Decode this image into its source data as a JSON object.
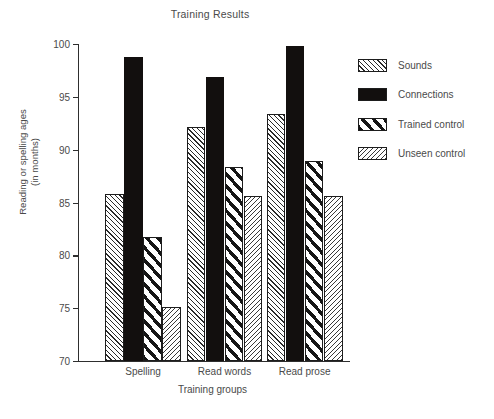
{
  "chart_data": {
    "type": "bar",
    "title": "Training Results",
    "xlabel": "Training groups",
    "ylabel": "Reading or spelling ages",
    "ylabel_line2": "(in months)",
    "categories": [
      "Spelling",
      "Read words",
      "Read prose"
    ],
    "series": [
      {
        "name": "Sounds",
        "values": [
          85.8,
          92.1,
          93.4
        ],
        "pattern": "diagonal-hatch-fine-up",
        "color": "#fdfdfd"
      },
      {
        "name": "Connections",
        "values": [
          98.8,
          96.9,
          99.8
        ],
        "pattern": "solid-black",
        "color": "#120f0e"
      },
      {
        "name": "Trained control",
        "values": [
          81.7,
          88.4,
          88.9
        ],
        "pattern": "diagonal-stripe-bold-up",
        "color": "#ffffff"
      },
      {
        "name": "Unseen control",
        "values": [
          75.1,
          85.6,
          85.6
        ],
        "pattern": "diagonal-hatch-fine-down",
        "color": "#fdfdfd"
      }
    ],
    "ylim": [
      70,
      100
    ],
    "yticks": [
      70,
      75,
      80,
      85,
      90,
      95,
      100
    ],
    "ytick_labels": [
      "70",
      "75",
      "80",
      "85",
      "90",
      "95",
      "100"
    ],
    "grid": false,
    "legend_position": "right",
    "axis_color": "#2e2e2e",
    "text_color": "#4a4a4a",
    "background": "#ffffff"
  },
  "legend": {
    "entries": [
      {
        "label": "Sounds"
      },
      {
        "label": "Connections"
      },
      {
        "label": "Trained control"
      },
      {
        "label": "Unseen control"
      }
    ]
  }
}
